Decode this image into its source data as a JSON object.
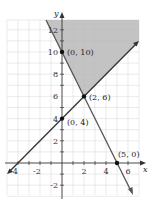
{
  "diagram": {
    "type": "linear-inequality-graph",
    "axes": {
      "x_label": "x",
      "y_label": "y",
      "x_ticks": [
        "-4",
        "-2",
        "2",
        "4",
        "6"
      ],
      "y_ticks": [
        "12",
        "10",
        "8",
        "6",
        "4",
        "2",
        "-2"
      ]
    },
    "lines": [
      {
        "name": "decreasing-line",
        "through": [
          [
            0,
            10
          ],
          [
            5,
            0
          ]
        ],
        "equation": "y = 10 - 2x"
      },
      {
        "name": "increasing-line",
        "through": [
          [
            0,
            4
          ],
          [
            2,
            6
          ]
        ],
        "equation": "y = x + 4"
      }
    ],
    "points": [
      {
        "label": "(0, 10)",
        "x": 0,
        "y": 10
      },
      {
        "label": "(2, 6)",
        "x": 2,
        "y": 6
      },
      {
        "label": "(0, 4)",
        "x": 0,
        "y": 4
      },
      {
        "label": "(5, 0)",
        "x": 5,
        "y": 0
      }
    ],
    "shaded_region": "above both lines",
    "colors": {
      "shade": "#b8b8b8",
      "grid": "#d8d8d8",
      "line": "#333333",
      "point": "#111111"
    }
  }
}
